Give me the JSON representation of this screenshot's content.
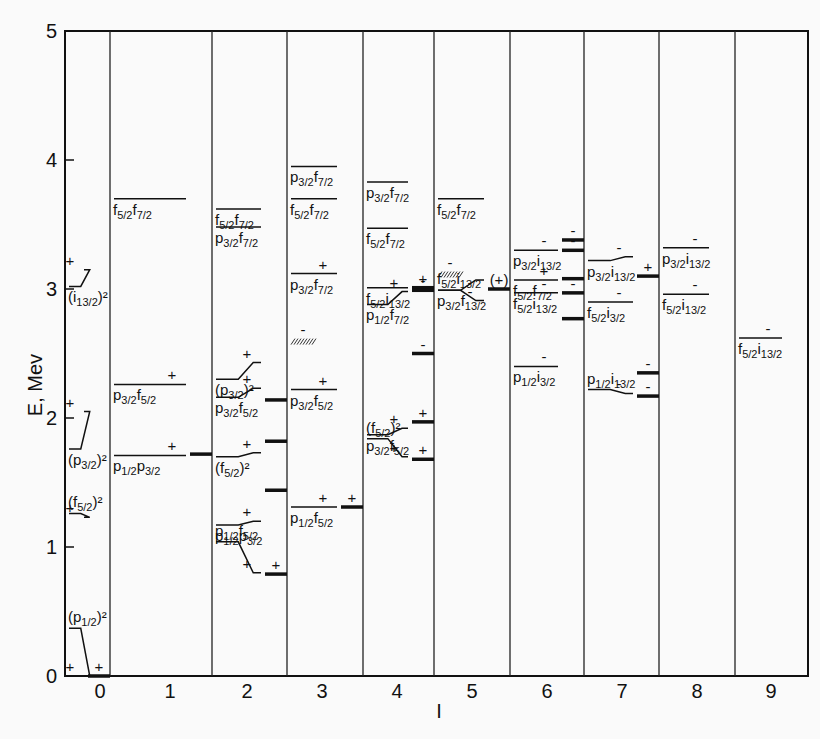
{
  "chart_data": {
    "type": "level-scheme",
    "title": "",
    "xlabel": "I",
    "ylabel": "E, Mev",
    "ylim": [
      0,
      5
    ],
    "yticks": [
      "0",
      "1",
      "2",
      "3",
      "4",
      "5"
    ],
    "xticks": [
      "0",
      "1",
      "2",
      "3",
      "4",
      "5",
      "6",
      "7",
      "8",
      "9"
    ],
    "grid": false,
    "columns": [
      {
        "I": 0,
        "levels": [
          {
            "config": "(i13/2)^2",
            "E_left": 3.02,
            "E_right": 3.15,
            "parity": "+"
          },
          {
            "config": "(p3/2)^2",
            "E_left": 1.76,
            "E_right": 2.05,
            "parity": "+"
          },
          {
            "config": "(f5/2)^2",
            "E_left": 1.26,
            "E_right": 1.23,
            "parity": "+"
          },
          {
            "config": "(p1/2)^2",
            "E_left": 0.37,
            "E_right": 0.0,
            "parity": "+"
          },
          {
            "config": "experimental",
            "E": 0.0,
            "parity": "+"
          }
        ]
      },
      {
        "I": 1,
        "levels": [
          {
            "config": "f5/2 f7/2",
            "E": 3.7
          },
          {
            "config": "p3/2 f5/2",
            "E": 2.26,
            "parity": "+"
          },
          {
            "config": "p1/2 p3/2",
            "E": 1.71,
            "parity": "+"
          },
          {
            "config": "experimental",
            "E": 1.72
          }
        ]
      },
      {
        "I": 2,
        "levels": [
          {
            "config": "f5/2 f7/2",
            "E": 3.62
          },
          {
            "config": "p3/2 f7/2",
            "E": 3.48
          },
          {
            "config": "(p3/2)^2",
            "E_left": 2.3,
            "E_right": 2.43,
            "parity": "+"
          },
          {
            "config": "p3/2 f5/2",
            "E_left": 2.16,
            "E_right": 2.23,
            "parity": "+"
          },
          {
            "config": "(f5/2)^2",
            "E_left": 1.7,
            "E_right": 1.73,
            "parity": "+"
          },
          {
            "config": "p1/2 p3/2",
            "E_left": 1.17,
            "E_right": 1.2,
            "parity": "+"
          },
          {
            "config": "p1/2 f5/2",
            "E_left": 1.04,
            "E_right": 0.8,
            "parity": "+"
          },
          {
            "config": "experimental",
            "E": 2.14
          },
          {
            "config": "experimental",
            "E": 1.82
          },
          {
            "config": "experimental",
            "E": 1.44
          },
          {
            "config": "experimental",
            "E": 0.79,
            "parity": "+"
          }
        ]
      },
      {
        "I": 3,
        "levels": [
          {
            "config": "p3/2 f7/2",
            "E": 3.95
          },
          {
            "config": "f5/2 f7/2",
            "E": 3.7
          },
          {
            "config": "p3/2 f7/2",
            "E": 3.12,
            "parity": "+"
          },
          {
            "config": "p3/2 f5/2",
            "E": 2.22,
            "parity": "+"
          },
          {
            "config": "p1/2 f5/2",
            "E": 1.31,
            "parity": "+"
          },
          {
            "config": "experimental-band",
            "E": 2.6,
            "parity": "-"
          },
          {
            "config": "experimental",
            "E": 1.31,
            "parity": "+"
          }
        ]
      },
      {
        "I": 4,
        "levels": [
          {
            "config": "p3/2 f7/2",
            "E": 3.83
          },
          {
            "config": "f5/2 f7/2",
            "E": 3.47
          },
          {
            "config": "f5/2 i13/2",
            "E": 3.01
          },
          {
            "config": "p1/2 f7/2",
            "E_left": 2.88,
            "E_right": 2.98,
            "parity": "+"
          },
          {
            "config": "p3/2 f5/2",
            "E_left": 1.87,
            "E_right": 1.92,
            "parity": "+"
          },
          {
            "config": "(f5/2)^2",
            "E_left": 1.84,
            "E_right": 1.7,
            "parity": "+"
          },
          {
            "config": "experimental",
            "E": 3.01,
            "parity": "+"
          },
          {
            "config": "experimental",
            "E": 2.99,
            "parity": "-"
          },
          {
            "config": "experimental",
            "E": 2.5,
            "parity": "-"
          },
          {
            "config": "experimental",
            "E": 1.97,
            "parity": "+"
          },
          {
            "config": "experimental",
            "E": 1.68,
            "parity": "+"
          }
        ]
      },
      {
        "I": 5,
        "levels": [
          {
            "config": "f5/2 f7/2",
            "E": 3.7
          },
          {
            "config": "p3/2 f13/2",
            "E_left": 2.99,
            "E_right": 3.07
          },
          {
            "config": "f5/2 i13/2",
            "E_left": 2.99,
            "E_right": 2.91,
            "parity": "-"
          },
          {
            "config": "experimental",
            "E": 3.0,
            "parity": "(+)"
          },
          {
            "config": "experimental-band",
            "E": 3.12,
            "parity": "-"
          }
        ]
      },
      {
        "I": 6,
        "levels": [
          {
            "config": "p3/2 i13/2",
            "E": 3.3,
            "parity": "-"
          },
          {
            "config": "f5/2 f7/2",
            "E": 3.07,
            "parity": "+"
          },
          {
            "config": "f5/2 i13/2",
            "E": 2.97,
            "parity": "-"
          },
          {
            "config": "p1/2 i3/2",
            "E": 2.4,
            "parity": "-"
          },
          {
            "config": "experimental",
            "E": 3.38,
            "parity": "-"
          },
          {
            "config": "experimental",
            "E": 3.3,
            "parity": "-"
          },
          {
            "config": "experimental",
            "E": 3.08
          },
          {
            "config": "experimental",
            "E": 2.97,
            "parity": "-"
          },
          {
            "config": "experimental",
            "E": 2.77
          }
        ]
      },
      {
        "I": 7,
        "levels": [
          {
            "config": "p3/2 i13/2",
            "E_left": 3.22,
            "E_right": 3.25,
            "parity": "-"
          },
          {
            "config": "f5/2 i3/2",
            "E": 2.9,
            "parity": "-"
          },
          {
            "config": "p1/2 i13/2",
            "E_left": 2.22,
            "E_right": 2.19,
            "parity": "-"
          },
          {
            "config": "experimental",
            "E": 3.1,
            "parity": "+"
          },
          {
            "config": "experimental",
            "E": 2.35,
            "parity": "-"
          },
          {
            "config": "experimental",
            "E": 2.17,
            "parity": "-"
          }
        ]
      },
      {
        "I": 8,
        "levels": [
          {
            "config": "p3/2 i13/2",
            "E": 3.32,
            "parity": "-"
          },
          {
            "config": "f5/2 i13/2",
            "E": 2.96,
            "parity": "-"
          }
        ]
      },
      {
        "I": 9,
        "levels": [
          {
            "config": "f5/2 i13/2",
            "E": 2.62,
            "parity": "-"
          }
        ]
      }
    ]
  }
}
